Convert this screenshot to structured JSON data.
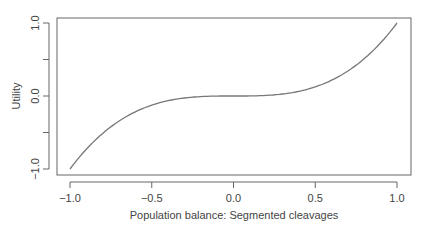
{
  "chart_data": {
    "type": "line",
    "title": "",
    "xlabel": "Population balance: Segmented cleavages",
    "ylabel": "Utility",
    "xlim": [
      -1.0,
      1.0
    ],
    "ylim": [
      -1.0,
      1.0
    ],
    "x_ticks": [
      "-1.0",
      "-0.5",
      "0.0",
      "0.5",
      "1.0"
    ],
    "y_ticks": [
      "-1.0",
      "0.0",
      "1.0"
    ],
    "grid": false,
    "legend": null,
    "series": [
      {
        "name": "utility",
        "x": [
          -1.0,
          -0.75,
          -0.5,
          -0.25,
          0.0,
          0.25,
          0.5,
          0.75,
          1.0
        ],
        "y": [
          -1.0,
          -0.42,
          -0.125,
          -0.016,
          0.0,
          0.016,
          0.125,
          0.42,
          1.0
        ]
      }
    ],
    "line_color": "#777777"
  }
}
